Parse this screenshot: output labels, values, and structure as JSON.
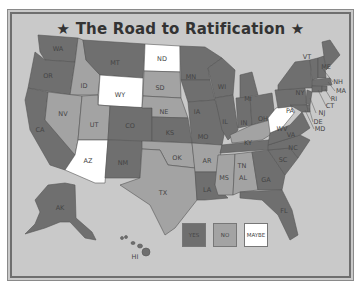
{
  "title": "★ The Road to Ratification ★",
  "colors": {
    "background": "#c9c9c9",
    "yes": "#6f6f6f",
    "no": "#a3a3a3",
    "maybe": "#ffffff",
    "border": "#555555"
  },
  "legend": [
    {
      "label": "YES",
      "color": "#6f6f6f"
    },
    {
      "label": "NO",
      "color": "#a3a3a3"
    },
    {
      "label": "MAYBE",
      "color": "#ffffff"
    }
  ],
  "states": {
    "yes": [
      "WA",
      "OR",
      "CA",
      "MT",
      "CO",
      "NM",
      "KS",
      "MN",
      "IA",
      "MO",
      "WI",
      "IL",
      "MI",
      "IN",
      "OH",
      "PA",
      "NY",
      "ME",
      "VT",
      "NH",
      "MA",
      "RI",
      "CT",
      "NJ",
      "DE",
      "MD",
      "VA",
      "NC",
      "SC",
      "TN",
      "GA",
      "FL",
      "LA",
      "AK",
      "HI"
    ],
    "no": [
      "ID",
      "NV",
      "UT",
      "SD",
      "NE",
      "OK",
      "TX",
      "AR",
      "MS",
      "AL",
      "KY"
    ],
    "maybe": [
      "ND",
      "WY",
      "AZ",
      "WV"
    ]
  },
  "labels": {
    "WA": "WA",
    "OR": "OR",
    "CA": "CA",
    "ID": "ID",
    "NV": "NV",
    "MT": "MT",
    "WY": "WY",
    "UT": "UT",
    "AZ": "AZ",
    "CO": "CO",
    "NM": "NM",
    "ND": "ND",
    "SD": "SD",
    "NE": "NE",
    "KS": "KS",
    "OK": "OK",
    "TX": "TX",
    "MN": "MN",
    "IA": "IA",
    "MO": "MO",
    "AR": "AR",
    "LA": "LA",
    "WI": "WI",
    "IL": "IL",
    "MI": "MI",
    "IN": "IN",
    "OH": "OH",
    "KY": "KY",
    "TN": "TN",
    "MS": "MS",
    "AL": "AL",
    "GA": "GA",
    "FL": "FL",
    "SC": "SC",
    "NC": "NC",
    "VA": "VA",
    "WV": "WV",
    "PA": "PA",
    "NY": "NY",
    "VT": "VT",
    "NH": "NH",
    "MA": "MA",
    "RI": "RI",
    "CT": "CT",
    "NJ": "NJ",
    "DE": "DE",
    "MD": "MD",
    "ME": "ME",
    "AK": "AK",
    "HI": "HI"
  }
}
